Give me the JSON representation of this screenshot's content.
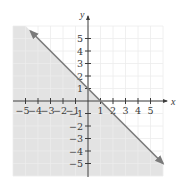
{
  "chart_data": {
    "type": "line",
    "title": "",
    "xlabel": "x",
    "ylabel": "y",
    "xlim": [
      -6,
      6
    ],
    "ylim": [
      -6,
      6
    ],
    "grid": true,
    "x_ticks": [
      -5,
      -4,
      -3,
      -2,
      -1,
      1,
      2,
      3,
      4,
      5
    ],
    "y_ticks": [
      -5,
      -4,
      -3,
      -2,
      -1,
      1,
      2,
      3,
      4,
      5
    ],
    "x_tick_labels": [
      "−5",
      "−4",
      "−3",
      "−2",
      "−1",
      "1",
      "2",
      "3",
      "4",
      "5"
    ],
    "y_tick_labels": [
      "5",
      "4",
      "3",
      "2",
      "1",
      "−1",
      "−2",
      "−3",
      "−4",
      "−5"
    ],
    "series": [
      {
        "name": "boundary line x + y = 1",
        "style": "solid",
        "arrows": "both",
        "x": [
          -4.6,
          6
        ],
        "y": [
          5.6,
          -5
        ]
      }
    ],
    "shaded_region": {
      "inequality": "x + y ≤ 1",
      "side": "below-left"
    },
    "colors": {
      "shade": "#e3e3e3",
      "grid": "#ececec",
      "line": "#7a7a7a",
      "axis": "#3c3c3c"
    }
  }
}
